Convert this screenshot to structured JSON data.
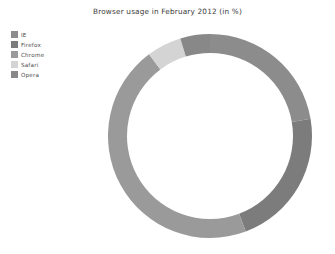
{
  "chart_data": {
    "type": "pie",
    "variant": "donut",
    "title": "Browser usage in February 2012 (in %)",
    "xlabel": "",
    "ylabel": "",
    "categories": [
      "IE",
      "Firefox",
      "Chrome",
      "Safari",
      "Opera"
    ],
    "values": [
      22.3,
      22.0,
      45.5,
      5.5,
      4.7
    ],
    "unit": "%",
    "colors": [
      "#8c8c8c",
      "#7c7c7c",
      "#9a9a9a",
      "#d4d4d4",
      "#888888"
    ],
    "legend": {
      "position": "top-left",
      "entries": [
        {
          "label": "IE",
          "color": "#8c8c8c",
          "value": 22.3
        },
        {
          "label": "Firefox",
          "color": "#7c7c7c",
          "value": 22.0
        },
        {
          "label": "Chrome",
          "color": "#9a9a9a",
          "value": 45.5
        },
        {
          "label": "Safari",
          "color": "#d4d4d4",
          "value": 5.5
        },
        {
          "label": "Opera",
          "color": "#888888",
          "value": 4.7
        }
      ]
    },
    "start_angle_deg": 90,
    "direction": "clockwise",
    "grid": false,
    "background": "#ffffff",
    "geometry": {
      "center_x": 210,
      "center_y": 136,
      "outer_radius": 102,
      "inner_radius": 83
    }
  },
  "figure": {
    "title": "Browser usage in February 2012 (in %)",
    "background_color": "#ffffff"
  }
}
